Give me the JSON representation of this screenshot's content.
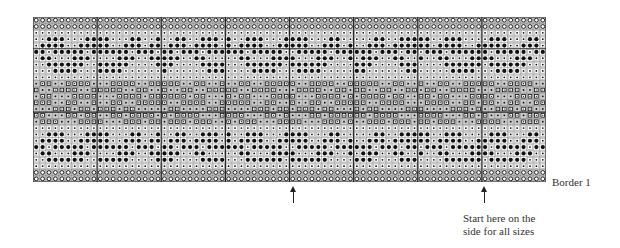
{
  "chart_data": {
    "type": "knitting-chart",
    "title": "",
    "columns": 80,
    "rows_count": 26,
    "block_size": 10,
    "legend": {
      "o": "border stitch (circle in grey square)",
      "d": "light stitch (small dot in white square)",
      "D": "dark stitch (large black dot)",
      "s": "contrast stitch (open square in grey cell)",
      "p": "small dot in grey cell"
    },
    "colors": {
      "grid": "#555555",
      "heavy_grid": "#222222",
      "grey_cell": "#c8c8c8",
      "white_cell": "#ffffff",
      "ink": "#111111"
    },
    "motif_rows": [
      "oooooooooo",
      "oooooooooo",
      "dddddddddd",
      "ddDDDdddDD",
      "dDDDDddDDD",
      "DDdDDDDDdD",
      "dDDdddDDDd",
      "ddDDDDDDdd",
      "dddDDDDddd",
      "dddddddddd",
      "pssppssssp",
      "sppsssspps",
      "psspppssss",
      "sssppsspps",
      "pppssspssp",
      "sspppsspss",
      "pssspppsss",
      "dddddddddd",
      "ddDDDdddDD",
      "dDDDDddDDD",
      "DDdDDDDDdD",
      "dDDdddDDDd",
      "ddDDDDDDdd",
      "dddddddddd",
      "oooooooooo",
      "oooooooooo"
    ],
    "annotations": [
      {
        "text": "Border 1",
        "position": "right of bottom border"
      },
      {
        "text": "Start here on the side for all sizes",
        "position": "below column ~70"
      }
    ],
    "arrows": [
      {
        "column": 40
      },
      {
        "column": 70
      }
    ]
  },
  "labels": {
    "border": "Border 1",
    "start_line1": "Start here on the",
    "start_line2": "side for all sizes"
  }
}
